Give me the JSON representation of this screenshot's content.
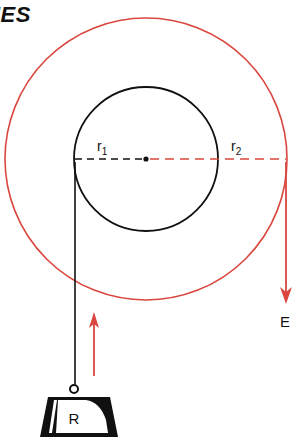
{
  "title_fragment": "IES",
  "labels": {
    "r1": "r",
    "r1_sub": "1",
    "r2": "r",
    "r2_sub": "2",
    "effort": "E",
    "resistance": "R"
  },
  "geometry": {
    "center": [
      146,
      159
    ],
    "inner_radius": 72,
    "outer_radius": 141
  },
  "colors": {
    "outer_wheel": "#d9473f",
    "inner_axle": "#111111",
    "effort_arrow": "#d9473f",
    "motion_arrow": "#d9473f",
    "rope": "#111111"
  }
}
